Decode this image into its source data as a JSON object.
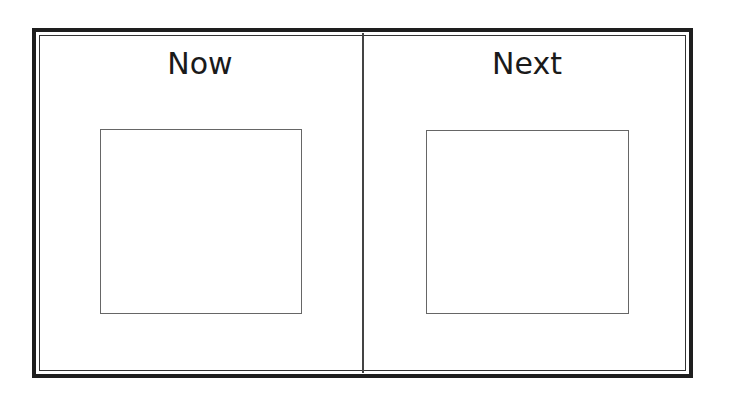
{
  "panels": [
    {
      "title": "Now"
    },
    {
      "title": "Next"
    }
  ],
  "colors": {
    "border": "#1e1e1e",
    "box_border": "#666666",
    "background": "#ffffff"
  }
}
